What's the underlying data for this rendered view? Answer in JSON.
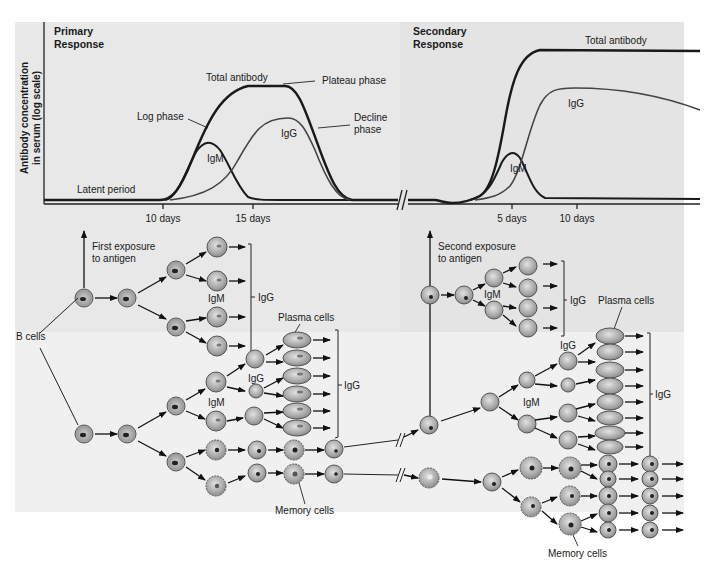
{
  "figure": {
    "primary": {
      "title_line1": "Primary",
      "title_line2": "Response",
      "labels": {
        "total_antibody": "Total antibody",
        "plateau_phase": "Plateau phase",
        "log_phase": "Log phase",
        "decline_line1": "Decline",
        "decline_line2": "phase",
        "igg": "IgG",
        "igm": "IgM",
        "latent_period": "Latent period"
      },
      "ticks": [
        "10 days",
        "15 days"
      ]
    },
    "secondary": {
      "title_line1": "Secondary",
      "title_line2": "Response",
      "labels": {
        "total_antibody": "Total antibody",
        "igg": "IgG",
        "igm": "IgM"
      },
      "ticks": [
        "5 days",
        "10 days"
      ]
    },
    "y_axis": {
      "line1": "Antibody concentration",
      "line2": "in serum (log scale)"
    },
    "lower_primary": {
      "exposure_line1": "First exposure",
      "exposure_line2": "to antigen",
      "b_cells": "B cells",
      "igm_top": "IgM",
      "igg_top": "IgG",
      "plasma_cells": "Plasma cells",
      "igg_mid": "IgG",
      "igm_mid": "IgM",
      "igg_right": "IgG",
      "memory_cells": "Memory cells"
    },
    "lower_secondary": {
      "exposure_line1": "Second exposure",
      "exposure_line2": "to antigen",
      "igm_top": "IgM",
      "igg_top": "IgG",
      "plasma_cells": "Plasma cells",
      "igg_mid": "IgG",
      "igm_mid": "IgM",
      "igg_right": "IgG",
      "memory_cells": "Memory cells"
    },
    "colors": {
      "panel_background": "#e8e8e8",
      "curve_dark": "#1a1a1a",
      "curve_igg": "#444444",
      "cell_fill": "#b5b5b5",
      "cell_nucleus": "#2a2a2a"
    }
  }
}
